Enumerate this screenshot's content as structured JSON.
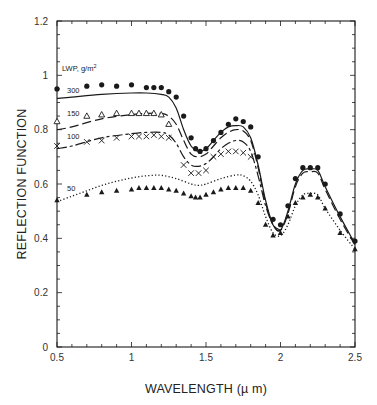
{
  "chart_data": {
    "type": "line",
    "title": "",
    "xlabel": "WAVELENGTH (µm)",
    "ylabel": "REFLECTION FUNCTION",
    "xlim": [
      0.5,
      2.5
    ],
    "ylim": [
      0,
      1.2
    ],
    "xticks": [
      0.5,
      1,
      1.5,
      2,
      2.5
    ],
    "xtick_labels": [
      "0.5",
      "1",
      "1.5",
      "2",
      "2.5"
    ],
    "yticks": [
      0,
      0.2,
      0.4,
      0.6,
      0.8,
      1,
      1.2
    ],
    "ytick_labels": [
      "0",
      "0.2",
      "0.4",
      "0.6",
      "0.8",
      "1",
      "1.2"
    ],
    "grid": false,
    "legend_title": "LWP, g/m²",
    "legend_position": "inline labels at left",
    "series": [
      {
        "name": "300",
        "kind": "model",
        "style": "solid",
        "x": [
          0.5,
          0.6,
          0.8,
          1.0,
          1.1,
          1.2,
          1.25,
          1.3,
          1.35,
          1.4,
          1.45,
          1.5,
          1.55,
          1.6,
          1.65,
          1.7,
          1.75,
          1.8,
          1.85,
          1.9,
          1.95,
          2.0,
          2.05,
          2.1,
          2.15,
          2.2,
          2.25,
          2.3,
          2.4,
          2.5
        ],
        "y": [
          0.915,
          0.92,
          0.93,
          0.935,
          0.935,
          0.93,
          0.92,
          0.88,
          0.8,
          0.74,
          0.72,
          0.73,
          0.76,
          0.79,
          0.81,
          0.815,
          0.81,
          0.77,
          0.67,
          0.54,
          0.45,
          0.43,
          0.5,
          0.6,
          0.65,
          0.655,
          0.65,
          0.59,
          0.48,
          0.38
        ]
      },
      {
        "name": "300",
        "kind": "observed",
        "marker": "filled-circle",
        "x": [
          0.5,
          0.7,
          0.8,
          0.9,
          1.0,
          1.1,
          1.15,
          1.2,
          1.25,
          1.3,
          1.35,
          1.4,
          1.43,
          1.46,
          1.5,
          1.55,
          1.6,
          1.65,
          1.7,
          1.75,
          1.8,
          1.85,
          1.95,
          2.0,
          2.05,
          2.1,
          2.15,
          2.2,
          2.25,
          2.3,
          2.4,
          2.5
        ],
        "y": [
          0.95,
          0.96,
          0.965,
          0.96,
          0.965,
          0.955,
          0.955,
          0.955,
          0.94,
          0.92,
          0.85,
          0.77,
          0.73,
          0.72,
          0.73,
          0.76,
          0.79,
          0.82,
          0.84,
          0.83,
          0.81,
          0.7,
          0.47,
          0.45,
          0.52,
          0.62,
          0.66,
          0.66,
          0.66,
          0.6,
          0.49,
          0.39
        ]
      },
      {
        "name": "150",
        "kind": "model",
        "style": "long-dash",
        "x": [
          0.5,
          0.6,
          0.8,
          1.0,
          1.1,
          1.2,
          1.25,
          1.3,
          1.35,
          1.4,
          1.45,
          1.5,
          1.55,
          1.6,
          1.65,
          1.7,
          1.75,
          1.8,
          1.85,
          1.9,
          1.95,
          2.0,
          2.05,
          2.1,
          2.15,
          2.2,
          2.25,
          2.3,
          2.4,
          2.5
        ],
        "y": [
          0.8,
          0.81,
          0.84,
          0.855,
          0.86,
          0.86,
          0.85,
          0.82,
          0.76,
          0.71,
          0.7,
          0.71,
          0.74,
          0.77,
          0.79,
          0.8,
          0.795,
          0.76,
          0.66,
          0.53,
          0.45,
          0.43,
          0.49,
          0.59,
          0.64,
          0.645,
          0.64,
          0.58,
          0.47,
          0.375
        ]
      },
      {
        "name": "150",
        "kind": "observed",
        "marker": "open-triangle",
        "x": [
          0.5,
          0.7,
          0.8,
          0.9,
          1.0,
          1.05,
          1.1,
          1.15,
          1.2,
          1.25
        ],
        "y": [
          0.83,
          0.85,
          0.855,
          0.86,
          0.86,
          0.86,
          0.86,
          0.86,
          0.855,
          0.82
        ]
      },
      {
        "name": "100",
        "kind": "model",
        "style": "short-long-dash",
        "x": [
          0.5,
          0.6,
          0.8,
          1.0,
          1.1,
          1.2,
          1.25,
          1.3,
          1.35,
          1.4,
          1.45,
          1.5,
          1.55,
          1.6,
          1.65,
          1.7,
          1.75,
          1.8,
          1.85,
          1.9,
          1.95,
          2.0
        ],
        "y": [
          0.73,
          0.74,
          0.77,
          0.785,
          0.79,
          0.79,
          0.78,
          0.75,
          0.7,
          0.67,
          0.665,
          0.675,
          0.7,
          0.73,
          0.75,
          0.76,
          0.755,
          0.72,
          0.63,
          0.52,
          0.45,
          0.43
        ]
      },
      {
        "name": "100",
        "kind": "observed",
        "marker": "x",
        "x": [
          0.5,
          0.7,
          0.8,
          0.9,
          1.0,
          1.05,
          1.1,
          1.15,
          1.2,
          1.25,
          1.35,
          1.4,
          1.45,
          1.5,
          1.55,
          1.6,
          1.65,
          1.7,
          1.75,
          1.8
        ],
        "y": [
          0.74,
          0.755,
          0.76,
          0.77,
          0.775,
          0.775,
          0.775,
          0.78,
          0.775,
          0.77,
          0.67,
          0.64,
          0.64,
          0.65,
          0.7,
          0.71,
          0.72,
          0.72,
          0.715,
          0.7
        ]
      },
      {
        "name": "50",
        "kind": "model",
        "style": "dotted",
        "x": [
          0.5,
          0.6,
          0.7,
          0.8,
          0.9,
          1.0,
          1.1,
          1.2,
          1.3,
          1.4,
          1.45,
          1.5,
          1.6,
          1.7,
          1.75,
          1.8,
          1.85,
          1.9,
          1.95,
          2.0,
          2.05,
          2.1,
          2.15,
          2.2,
          2.25,
          2.3,
          2.4,
          2.5
        ],
        "y": [
          0.535,
          0.555,
          0.575,
          0.595,
          0.61,
          0.622,
          0.63,
          0.632,
          0.62,
          0.6,
          0.595,
          0.6,
          0.62,
          0.633,
          0.63,
          0.61,
          0.56,
          0.48,
          0.42,
          0.41,
          0.45,
          0.52,
          0.56,
          0.565,
          0.56,
          0.51,
          0.43,
          0.36
        ]
      },
      {
        "name": "50",
        "kind": "observed",
        "marker": "filled-triangle",
        "x": [
          0.5,
          0.7,
          0.8,
          0.9,
          1.0,
          1.05,
          1.1,
          1.15,
          1.2,
          1.25,
          1.3,
          1.35,
          1.4,
          1.43,
          1.46,
          1.5,
          1.55,
          1.6,
          1.65,
          1.7,
          1.75,
          1.8,
          1.85,
          1.9,
          1.95,
          2.0,
          2.05,
          2.1,
          2.15,
          2.2,
          2.25,
          2.3,
          2.4,
          2.5
        ],
        "y": [
          0.54,
          0.56,
          0.57,
          0.575,
          0.58,
          0.585,
          0.585,
          0.585,
          0.585,
          0.58,
          0.575,
          0.565,
          0.555,
          0.55,
          0.55,
          0.56,
          0.57,
          0.58,
          0.585,
          0.585,
          0.585,
          0.575,
          0.53,
          0.45,
          0.41,
          0.42,
          0.48,
          0.53,
          0.55,
          0.56,
          0.55,
          0.51,
          0.42,
          0.36
        ]
      }
    ],
    "annotations": [
      "LWP, g/m²",
      "300",
      "150",
      "100",
      "50"
    ]
  },
  "labels": {
    "legend_title": "LWP, g/m",
    "legend_sup": "2",
    "curve_300": "300",
    "curve_150": "150",
    "curve_100": "100",
    "curve_50": "50",
    "x_title": "WAVELENGTH (µ m)",
    "y_title": "REFLECTION FUNCTION"
  },
  "colors": {
    "ink": "#1a1a1a",
    "background": "#ffffff"
  }
}
